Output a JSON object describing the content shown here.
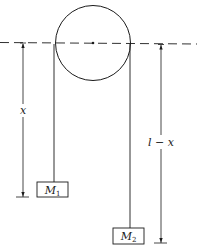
{
  "diagram": {
    "labels": {
      "left_length": "x",
      "right_length": "l − x"
    },
    "masses": [
      {
        "name": "M",
        "subscript": "1"
      },
      {
        "name": "M",
        "subscript": "2"
      }
    ],
    "colors": {
      "line": "#1a1a1a",
      "background": "#ffffff"
    }
  }
}
